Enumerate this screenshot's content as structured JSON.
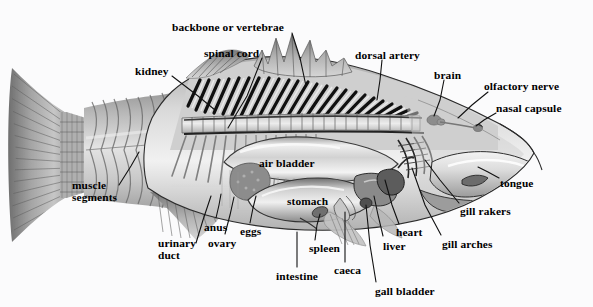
{
  "diagram": {
    "style": "grayscale cutaway illustration",
    "background_color": "#fbfbfc",
    "label_color": "#000000",
    "leader_line_color": "#111111",
    "labels": [
      {
        "id": "backbone",
        "text": "backbone or vertebrae",
        "x": 172,
        "y": 22,
        "align": "left",
        "leader": [
          [
            292,
            33
          ],
          [
            300,
            58
          ],
          [
            306,
            86
          ]
        ]
      },
      {
        "id": "spinal-cord",
        "text": "spinal cord",
        "x": 204,
        "y": 48,
        "align": "left",
        "leader": [
          [
            262,
            58
          ],
          [
            247,
            96
          ],
          [
            228,
            128
          ]
        ]
      },
      {
        "id": "kidney",
        "text": "kidney",
        "x": 135,
        "y": 66,
        "align": "left",
        "leader": [
          [
            172,
            76
          ],
          [
            198,
            96
          ],
          [
            215,
            110
          ]
        ]
      },
      {
        "id": "dorsal-artery",
        "text": "dorsal artery",
        "x": 355,
        "y": 50,
        "align": "left",
        "leader": [
          [
            382,
            60
          ],
          [
            380,
            80
          ],
          [
            377,
            100
          ]
        ]
      },
      {
        "id": "brain",
        "text": "brain",
        "x": 434,
        "y": 70,
        "align": "left",
        "leader": [
          [
            444,
            80
          ],
          [
            440,
            100
          ],
          [
            434,
            116
          ]
        ]
      },
      {
        "id": "olfactory-nerve",
        "text": "olfactory nerve",
        "x": 484,
        "y": 81,
        "align": "left",
        "leader": [
          [
            488,
            92
          ],
          [
            472,
            105
          ],
          [
            458,
            118
          ]
        ]
      },
      {
        "id": "nasal-capsule",
        "text": "nasal capsule",
        "x": 496,
        "y": 103,
        "align": "left",
        "leader": [
          [
            496,
            113
          ],
          [
            484,
            120
          ],
          [
            476,
            126
          ]
        ]
      },
      {
        "id": "tongue",
        "text": "tongue",
        "x": 500,
        "y": 178,
        "align": "left",
        "leader": [
          [
            499,
            178
          ],
          [
            488,
            172
          ],
          [
            478,
            167
          ]
        ]
      },
      {
        "id": "gill-rakers",
        "text": "gill rakers",
        "x": 460,
        "y": 206,
        "align": "left",
        "leader": [
          [
            459,
            203
          ],
          [
            440,
            180
          ],
          [
            425,
            160
          ]
        ]
      },
      {
        "id": "gill-arches",
        "text": "gill arches",
        "x": 442,
        "y": 239,
        "align": "left",
        "leader": [
          [
            441,
            235
          ],
          [
            425,
            205
          ],
          [
            412,
            168
          ]
        ]
      },
      {
        "id": "heart",
        "text": "heart",
        "x": 396,
        "y": 227,
        "align": "left",
        "leader": [
          [
            399,
            224
          ],
          [
            392,
            205
          ],
          [
            385,
            180
          ]
        ]
      },
      {
        "id": "liver",
        "text": "liver",
        "x": 383,
        "y": 241,
        "align": "left",
        "leader": [
          [
            383,
            236
          ],
          [
            378,
            215
          ],
          [
            374,
            196
          ]
        ]
      },
      {
        "id": "gall-bladder",
        "text": "gall bladder",
        "x": 375,
        "y": 286,
        "align": "left",
        "leader": [
          [
            376,
            282
          ],
          [
            370,
            245
          ],
          [
            366,
            205
          ]
        ]
      },
      {
        "id": "caeca",
        "text": "caeca",
        "x": 334,
        "y": 265,
        "align": "left",
        "leader": [
          [
            345,
            262
          ],
          [
            345,
            235
          ],
          [
            345,
            212
          ]
        ]
      },
      {
        "id": "spleen",
        "text": "spleen",
        "x": 309,
        "y": 243,
        "align": "left",
        "leader": [
          [
            315,
            240
          ],
          [
            317,
            225
          ],
          [
            320,
            214
          ]
        ]
      },
      {
        "id": "intestine",
        "text": "intestine",
        "x": 276,
        "y": 271,
        "align": "left",
        "leader": [
          [
            297,
            267
          ],
          [
            297,
            250
          ],
          [
            297,
            232
          ]
        ]
      },
      {
        "id": "stomach",
        "text": "stomach",
        "x": 287,
        "y": 196,
        "align": "left",
        "leader": []
      },
      {
        "id": "air-bladder",
        "text": "air bladder",
        "x": 259,
        "y": 158,
        "align": "left",
        "leader": []
      },
      {
        "id": "eggs",
        "text": "eggs",
        "x": 240,
        "y": 226,
        "align": "left",
        "leader": [
          [
            250,
            223
          ],
          [
            253,
            208
          ],
          [
            256,
            196
          ]
        ]
      },
      {
        "id": "ovary",
        "text": "ovary",
        "x": 208,
        "y": 238,
        "align": "left",
        "leader": [
          [
            225,
            234
          ],
          [
            230,
            215
          ],
          [
            234,
            197
          ]
        ]
      },
      {
        "id": "anus",
        "text": "anus",
        "x": 204,
        "y": 222,
        "align": "left",
        "leader": [
          [
            216,
            218
          ],
          [
            219,
            205
          ],
          [
            221,
            194
          ]
        ]
      },
      {
        "id": "urinary-duct",
        "text": "urinary\nduct",
        "x": 158,
        "y": 238,
        "align": "left",
        "leader": [
          [
            196,
            243
          ],
          [
            203,
            220
          ],
          [
            211,
            196
          ]
        ]
      },
      {
        "id": "muscle-segments",
        "text": "muscle\nsegments",
        "x": 72,
        "y": 180,
        "align": "left",
        "leader": [
          [
            119,
            185
          ],
          [
            131,
            166
          ],
          [
            139,
            152
          ]
        ]
      }
    ],
    "parts_count": 23
  }
}
